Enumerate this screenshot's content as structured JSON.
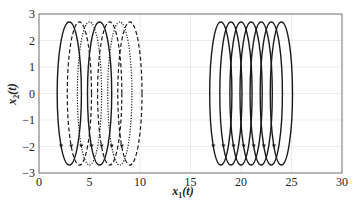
{
  "chart_data": {
    "type": "line",
    "title": "",
    "xlabel": "x1(t)",
    "ylabel": "x2(t)",
    "xlabel_main": "x",
    "xlabel_sub": "1",
    "xlabel_tail": "(t)",
    "ylabel_main": "x",
    "ylabel_sub": "2",
    "ylabel_tail": "(t)",
    "xlim": [
      0,
      30
    ],
    "ylim": [
      -3,
      3
    ],
    "xticks": [
      0,
      5,
      10,
      15,
      20,
      25,
      30
    ],
    "yticks": [
      3,
      2,
      1,
      0,
      -1,
      -2,
      -3
    ],
    "xtick_labels": [
      "0",
      "5",
      "10",
      "15",
      "20",
      "25",
      "30"
    ],
    "ytick_labels": [
      "3",
      "2",
      "1",
      "0",
      "−1",
      "−2",
      "−3"
    ],
    "grid": true,
    "legend": null,
    "series": [
      {
        "name": "left-group",
        "style": "mixed solid/dashed/dotted",
        "centers_x": [
          3,
          4,
          5,
          6,
          7,
          8,
          9
        ],
        "half_width": 1.2,
        "half_height": 2.7,
        "styles": [
          "solid",
          "dashed",
          "dotted",
          "solid",
          "dashed",
          "dotted",
          "dashed"
        ]
      },
      {
        "name": "right-group",
        "style": "solid",
        "centers_x": [
          18,
          19,
          20,
          21,
          22,
          23,
          24
        ],
        "half_width": 1.1,
        "half_height": 2.7,
        "styles": [
          "solid",
          "solid",
          "solid",
          "solid",
          "solid",
          "solid",
          "solid"
        ]
      }
    ]
  }
}
